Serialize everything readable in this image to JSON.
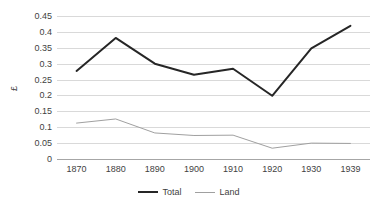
{
  "chart_data": {
    "type": "line",
    "title": "",
    "xlabel": "",
    "ylabel": "£",
    "categories": [
      "1870",
      "1880",
      "1890",
      "1900",
      "1910",
      "1920",
      "1930",
      "1939"
    ],
    "ylim": [
      0,
      0.45
    ],
    "ytick_step": 0.05,
    "yticks": [
      "0.45",
      "0.4",
      "0.35",
      "0.3",
      "0.25",
      "0.2",
      "0.15",
      "0.1",
      "0.05",
      "0"
    ],
    "ytick_values": [
      0.45,
      0.4,
      0.35,
      0.3,
      0.25,
      0.2,
      0.15,
      0.1,
      0.05,
      0
    ],
    "grid": true,
    "legend_position": "bottom-center",
    "series": [
      {
        "name": "Total",
        "color": "#262626",
        "width": 2,
        "values": [
          0.277,
          0.381,
          0.3,
          0.265,
          0.284,
          0.199,
          0.348,
          0.419
        ]
      },
      {
        "name": "Land",
        "color": "#a0a0a0",
        "width": 1,
        "values": [
          0.113,
          0.126,
          0.082,
          0.074,
          0.075,
          0.034,
          0.05,
          0.049
        ]
      }
    ]
  },
  "axis": {
    "y_title": "£"
  },
  "legend": {
    "items": [
      {
        "label": "Total"
      },
      {
        "label": "Land"
      }
    ]
  },
  "colors": {
    "total": "#262626",
    "land": "#a0a0a0",
    "grid": "#d9d9d9",
    "axis": "#a6a6a6",
    "text": "#3f3f3f",
    "background": "#ffffff"
  }
}
